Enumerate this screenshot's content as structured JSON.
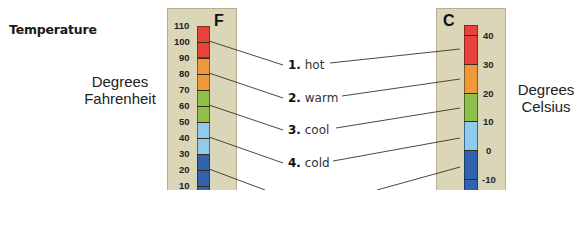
{
  "title": "Temperature",
  "left_axis": {
    "line1": "Degrees",
    "line2": "Fahrenheit",
    "unit": "F",
    "ticks": [
      "110",
      "100",
      "90",
      "80",
      "70",
      "60",
      "50",
      "40",
      "30",
      "20",
      "10"
    ]
  },
  "right_axis": {
    "line1": "Degrees",
    "line2": "Celsius",
    "unit": "C",
    "ticks": [
      "40",
      "30",
      "20",
      "10",
      "0",
      "-10"
    ]
  },
  "categories": [
    {
      "num": "1.",
      "name": "hot",
      "color": "#e8423a"
    },
    {
      "num": "2.",
      "name": "warm",
      "color": "#ee9a3a"
    },
    {
      "num": "3.",
      "name": "cool",
      "color": "#8cc04a"
    },
    {
      "num": "4.",
      "name": "cold",
      "color": "#90cbee"
    },
    {
      "num": "5.",
      "name": "",
      "color": "#2f63ad"
    }
  ]
}
